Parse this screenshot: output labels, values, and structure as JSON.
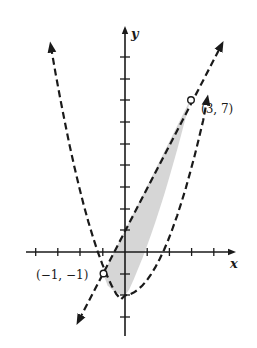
{
  "graph": {
    "x_axis_label": "x",
    "y_axis_label": "y",
    "points": [
      {
        "label": "(3, 7)",
        "x": 3,
        "y": 7
      },
      {
        "label": "(-1, -1)",
        "display": "(−1, −1)",
        "x": -1,
        "y": -1
      }
    ],
    "curves": [
      {
        "name": "parabola",
        "equation": "y = x^2 - 2",
        "style": "dashed"
      },
      {
        "name": "line",
        "equation": "y = 2x + 1",
        "style": "dashed"
      }
    ],
    "shaded_region": "x^2 - 2 < y < 2x + 1",
    "colors": {
      "ink": "#1a1a1a",
      "shade": "#d4d4d4"
    }
  }
}
